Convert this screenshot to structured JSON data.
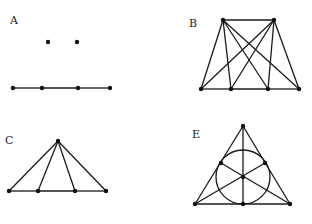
{
  "figures": [
    {
      "label": "A",
      "points": [
        [
          48,
          42
        ],
        [
          77,
          42
        ],
        [
          13,
          88
        ],
        [
          42,
          88
        ],
        [
          78,
          88
        ],
        [
          110,
          88
        ]
      ],
      "edges": [
        [
          2,
          3
        ],
        [
          3,
          4
        ],
        [
          4,
          5
        ]
      ],
      "label_pos": [
        10,
        24
      ]
    },
    {
      "label": "B",
      "points": [
        [
          223,
          20
        ],
        [
          274,
          20
        ],
        [
          201,
          89
        ],
        [
          231,
          89
        ],
        [
          268,
          89
        ],
        [
          299,
          89
        ]
      ],
      "edges": [
        [
          0,
          1
        ],
        [
          2,
          3
        ],
        [
          3,
          4
        ],
        [
          4,
          5
        ],
        [
          0,
          2
        ],
        [
          0,
          3
        ],
        [
          0,
          4
        ],
        [
          0,
          5
        ],
        [
          1,
          2
        ],
        [
          1,
          3
        ],
        [
          1,
          4
        ],
        [
          1,
          5
        ]
      ],
      "label_pos": [
        189,
        27
      ]
    },
    {
      "label": "C",
      "points": [
        [
          58,
          141
        ],
        [
          9,
          191
        ],
        [
          38,
          191
        ],
        [
          75,
          191
        ],
        [
          106,
          191
        ]
      ],
      "edges": [
        [
          1,
          2
        ],
        [
          2,
          3
        ],
        [
          3,
          4
        ],
        [
          0,
          1
        ],
        [
          0,
          2
        ],
        [
          0,
          3
        ],
        [
          0,
          4
        ]
      ],
      "label_pos": [
        5,
        144
      ]
    },
    {
      "label": "E",
      "points": [
        [
          243,
          126
        ],
        [
          195,
          204
        ],
        [
          243,
          204
        ],
        [
          290,
          204
        ],
        [
          221,
          163
        ],
        [
          265,
          163
        ],
        [
          243,
          177
        ]
      ],
      "edges": [
        [
          0,
          1
        ],
        [
          0,
          3
        ],
        [
          1,
          3
        ],
        [
          0,
          2
        ],
        [
          1,
          5
        ],
        [
          3,
          4
        ]
      ],
      "circle": {
        "center": [
          243,
          177
        ],
        "r": 27
      },
      "label_pos": [
        192,
        138
      ]
    }
  ]
}
